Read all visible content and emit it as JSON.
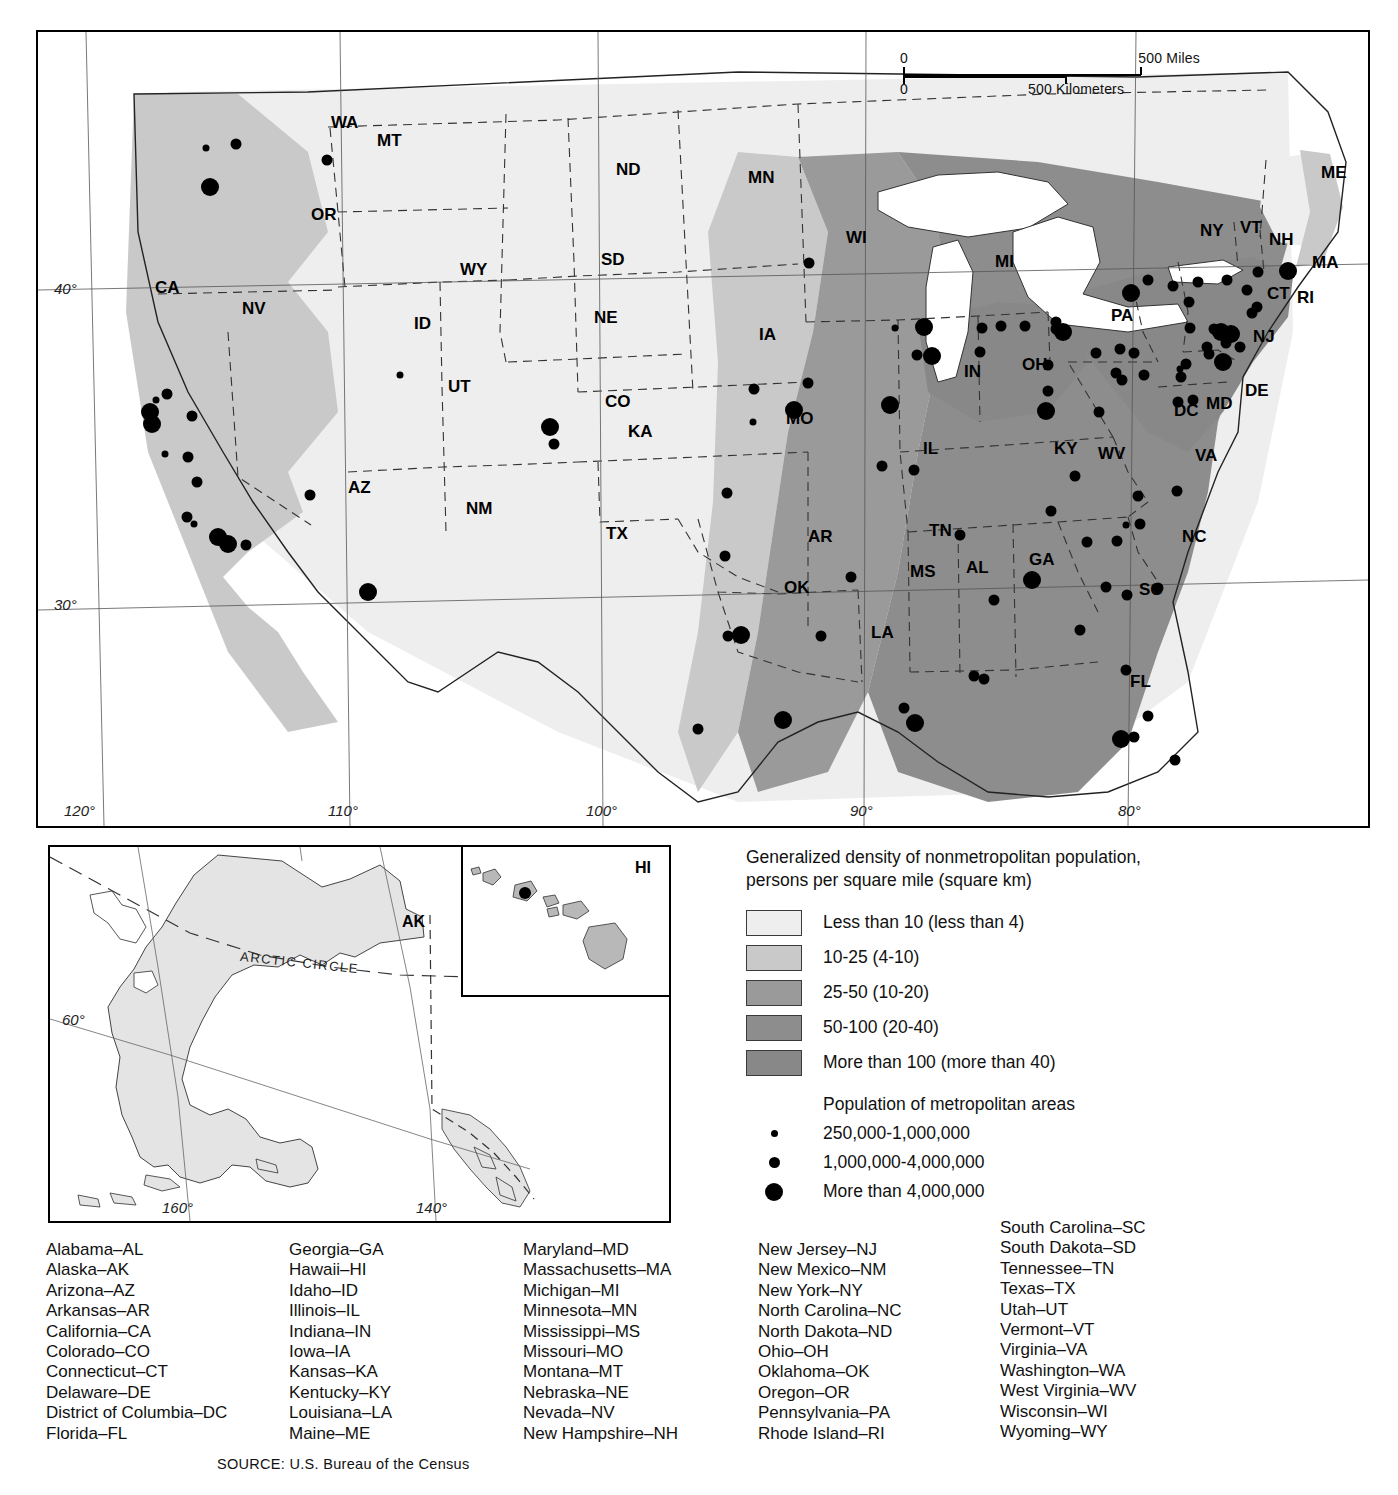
{
  "map": {
    "title_implicit": "Generalized density of nonmetropolitan population",
    "scale": {
      "miles_zero": "0",
      "miles_max": "500 Miles",
      "km_zero": "0",
      "km_max": "500 Kilometers"
    },
    "longitude_labels": [
      "120°",
      "110°",
      "100°",
      "90°",
      "80°"
    ],
    "latitude_labels": [
      "40°",
      "30°"
    ],
    "state_labels": [
      {
        "abbr": "WA",
        "x": 293,
        "y": 96
      },
      {
        "abbr": "MT",
        "x": 339,
        "y": 114
      },
      {
        "abbr": "ND",
        "x": 578,
        "y": 143
      },
      {
        "abbr": "MN",
        "x": 710,
        "y": 151
      },
      {
        "abbr": "OR",
        "x": 273,
        "y": 188
      },
      {
        "abbr": "WI",
        "x": 808,
        "y": 211
      },
      {
        "abbr": "MI",
        "x": 957,
        "y": 235
      },
      {
        "abbr": "ME",
        "x": 1283,
        "y": 146
      },
      {
        "abbr": "NY",
        "x": 1162,
        "y": 204
      },
      {
        "abbr": "VT",
        "x": 1202,
        "y": 201
      },
      {
        "abbr": "NH",
        "x": 1231,
        "y": 213
      },
      {
        "abbr": "MA",
        "x": 1274,
        "y": 236
      },
      {
        "abbr": "SD",
        "x": 563,
        "y": 233
      },
      {
        "abbr": "WY",
        "x": 422,
        "y": 243
      },
      {
        "abbr": "CA",
        "x": 117,
        "y": 261
      },
      {
        "abbr": "NV",
        "x": 204,
        "y": 282
      },
      {
        "abbr": "ID",
        "x": 376,
        "y": 297
      },
      {
        "abbr": "NE",
        "x": 556,
        "y": 291
      },
      {
        "abbr": "IA",
        "x": 721,
        "y": 308
      },
      {
        "abbr": "PA",
        "x": 1073,
        "y": 289
      },
      {
        "abbr": "CT",
        "x": 1229,
        "y": 267
      },
      {
        "abbr": "RI",
        "x": 1259,
        "y": 271
      },
      {
        "abbr": "OH",
        "x": 984,
        "y": 338
      },
      {
        "abbr": "IN",
        "x": 926,
        "y": 345
      },
      {
        "abbr": "NJ",
        "x": 1215,
        "y": 310
      },
      {
        "abbr": "UT",
        "x": 410,
        "y": 360
      },
      {
        "abbr": "CO",
        "x": 567,
        "y": 375
      },
      {
        "abbr": "MO",
        "x": 748,
        "y": 392
      },
      {
        "abbr": "KA",
        "x": 590,
        "y": 405
      },
      {
        "abbr": "DC",
        "x": 1136,
        "y": 384
      },
      {
        "abbr": "MD",
        "x": 1168,
        "y": 377
      },
      {
        "abbr": "DE",
        "x": 1207,
        "y": 364
      },
      {
        "abbr": "IL",
        "x": 885,
        "y": 422
      },
      {
        "abbr": "KY",
        "x": 1016,
        "y": 422
      },
      {
        "abbr": "WV",
        "x": 1060,
        "y": 427
      },
      {
        "abbr": "VA",
        "x": 1157,
        "y": 429
      },
      {
        "abbr": "AZ",
        "x": 310,
        "y": 461
      },
      {
        "abbr": "NM",
        "x": 428,
        "y": 482
      },
      {
        "abbr": "TN",
        "x": 891,
        "y": 504
      },
      {
        "abbr": "AR",
        "x": 770,
        "y": 510
      },
      {
        "abbr": "NC",
        "x": 1144,
        "y": 510
      },
      {
        "abbr": "TX",
        "x": 568,
        "y": 507
      },
      {
        "abbr": "MS",
        "x": 872,
        "y": 545
      },
      {
        "abbr": "AL",
        "x": 928,
        "y": 541
      },
      {
        "abbr": "GA",
        "x": 991,
        "y": 533
      },
      {
        "abbr": "SC",
        "x": 1101,
        "y": 563
      },
      {
        "abbr": "OK",
        "x": 746,
        "y": 561
      },
      {
        "abbr": "LA",
        "x": 833,
        "y": 606
      },
      {
        "abbr": "FL",
        "x": 1092,
        "y": 655
      }
    ]
  },
  "insets": {
    "alaska": {
      "label": "AK",
      "arctic_circle": "ARCTIC CIRCLE",
      "lat_label": "60°",
      "lon_labels": [
        "160°",
        "140°"
      ]
    },
    "hawaii": {
      "label": "HI"
    }
  },
  "legend": {
    "title": "Generalized density of nonmetropolitan population,\npersons per square mile (square km)",
    "density_classes": [
      {
        "label": "Less than 10 (less than 4)",
        "color": "#eeeeee"
      },
      {
        "label": "10-25 (4-10)",
        "color": "#c9c9c9"
      },
      {
        "label": "25-50 (10-20)",
        "color": "#9a9a9a"
      },
      {
        "label": "50-100 (20-40)",
        "color": "#8d8d8d"
      },
      {
        "label": "More than 100 (more than 40)",
        "color": "#888888"
      }
    ],
    "metro_title": "Population of metropolitan areas",
    "metro_classes": [
      {
        "label": "250,000-1,000,000",
        "size": "small"
      },
      {
        "label": "1,000,000-4,000,000",
        "size": "medium"
      },
      {
        "label": "More than 4,000,000",
        "size": "large"
      }
    ]
  },
  "abbreviations": {
    "column_1": [
      "Alabama–AL",
      "Alaska–AK",
      "Arizona–AZ",
      "Arkansas–AR",
      "California–CA",
      "Colorado–CO",
      "Connecticut–CT",
      "Delaware–DE",
      "District of Columbia–DC",
      "Florida–FL"
    ],
    "column_2": [
      "Georgia–GA",
      "Hawaii–HI",
      "Idaho–ID",
      "Illinois–IL",
      "Indiana–IN",
      "Iowa–IA",
      "Kansas–KA",
      "Kentucky–KY",
      "Louisiana–LA",
      "Maine–ME"
    ],
    "column_3": [
      "Maryland–MD",
      "Massachusetts–MA",
      "Michigan–MI",
      "Minnesota–MN",
      "Mississippi–MS",
      "Missouri–MO",
      "Montana–MT",
      "Nebraska–NE",
      "Nevada–NV",
      "New Hampshire–NH"
    ],
    "column_4": [
      "New Jersey–NJ",
      "New Mexico–NM",
      "New York–NY",
      "North Carolina–NC",
      "North Dakota–ND",
      "Ohio–OH",
      "Oklahoma–OK",
      "Oregon–OR",
      "Pennsylvania–PA",
      "Rhode Island–RI"
    ],
    "column_5": [
      "South Carolina–SC",
      "South Dakota–SD",
      "Tennessee–TN",
      "Texas–TX",
      "Utah–UT",
      "Vermont–VT",
      "Virginia–VA",
      "Washington–WA",
      "West Virginia–WV",
      "Wisconsin–WI",
      "Wyoming–WY"
    ]
  },
  "source": "SOURCE: U.S. Bureau of the Census",
  "chart_data": {
    "type": "map",
    "title": "Generalized density of nonmetropolitan population, persons per square mile (square km)",
    "density_bands": [
      {
        "class": "Less than 10 (less than 4)",
        "fill": "#eeeeee"
      },
      {
        "class": "10-25 (4-10)",
        "fill": "#c9c9c9"
      },
      {
        "class": "25-50 (10-20)",
        "fill": "#9a9a9a"
      },
      {
        "class": "50-100 (20-40)",
        "fill": "#8d8d8d"
      },
      {
        "class": "More than 100 (more than 40)",
        "fill": "#888888"
      }
    ],
    "metro_symbol_sizes": [
      {
        "class": "250,000-1,000,000",
        "radius_px": 3.5
      },
      {
        "class": "1,000,000-4,000,000",
        "radius_px": 5.5
      },
      {
        "class": "More than 4,000,000",
        "radius_px": 9
      }
    ],
    "metro_points": [
      {
        "x": 198,
        "y": 112,
        "size": "m"
      },
      {
        "x": 172,
        "y": 155,
        "size": "l"
      },
      {
        "x": 168,
        "y": 116,
        "size": "s"
      },
      {
        "x": 289,
        "y": 128,
        "size": "m"
      },
      {
        "x": 129,
        "y": 362,
        "size": "m"
      },
      {
        "x": 118,
        "y": 368,
        "size": "s"
      },
      {
        "x": 112,
        "y": 380,
        "size": "l"
      },
      {
        "x": 114,
        "y": 392,
        "size": "l"
      },
      {
        "x": 154,
        "y": 384,
        "size": "m"
      },
      {
        "x": 150,
        "y": 425,
        "size": "m"
      },
      {
        "x": 127,
        "y": 422,
        "size": "s"
      },
      {
        "x": 159,
        "y": 450,
        "size": "m"
      },
      {
        "x": 149,
        "y": 485,
        "size": "m"
      },
      {
        "x": 156,
        "y": 492,
        "size": "s"
      },
      {
        "x": 180,
        "y": 505,
        "size": "l"
      },
      {
        "x": 190,
        "y": 512,
        "size": "l"
      },
      {
        "x": 208,
        "y": 513,
        "size": "m"
      },
      {
        "x": 272,
        "y": 463,
        "size": "m"
      },
      {
        "x": 330,
        "y": 560,
        "size": "l"
      },
      {
        "x": 362,
        "y": 343,
        "size": "s"
      },
      {
        "x": 512,
        "y": 395,
        "size": "l"
      },
      {
        "x": 516,
        "y": 412,
        "size": "m"
      },
      {
        "x": 689,
        "y": 461,
        "size": "m"
      },
      {
        "x": 687,
        "y": 524,
        "size": "m"
      },
      {
        "x": 660,
        "y": 697,
        "size": "m"
      },
      {
        "x": 690,
        "y": 604,
        "size": "m"
      },
      {
        "x": 703,
        "y": 603,
        "size": "l"
      },
      {
        "x": 745,
        "y": 688,
        "size": "l"
      },
      {
        "x": 771,
        "y": 231,
        "size": "m"
      },
      {
        "x": 770,
        "y": 351,
        "size": "m"
      },
      {
        "x": 756,
        "y": 378,
        "size": "l"
      },
      {
        "x": 716,
        "y": 357,
        "size": "m"
      },
      {
        "x": 715,
        "y": 390,
        "size": "s"
      },
      {
        "x": 783,
        "y": 604,
        "size": "m"
      },
      {
        "x": 813,
        "y": 545,
        "size": "m"
      },
      {
        "x": 844,
        "y": 434,
        "size": "m"
      },
      {
        "x": 852,
        "y": 373,
        "size": "l"
      },
      {
        "x": 866,
        "y": 676,
        "size": "m"
      },
      {
        "x": 877,
        "y": 691,
        "size": "l"
      },
      {
        "x": 857,
        "y": 296,
        "size": "s"
      },
      {
        "x": 886,
        "y": 295,
        "size": "l"
      },
      {
        "x": 894,
        "y": 324,
        "size": "l"
      },
      {
        "x": 879,
        "y": 323,
        "size": "m"
      },
      {
        "x": 876,
        "y": 438,
        "size": "m"
      },
      {
        "x": 936,
        "y": 644,
        "size": "m"
      },
      {
        "x": 946,
        "y": 647,
        "size": "m"
      },
      {
        "x": 922,
        "y": 503,
        "size": "m"
      },
      {
        "x": 956,
        "y": 568,
        "size": "m"
      },
      {
        "x": 944,
        "y": 296,
        "size": "m"
      },
      {
        "x": 942,
        "y": 320,
        "size": "m"
      },
      {
        "x": 963,
        "y": 294,
        "size": "m"
      },
      {
        "x": 987,
        "y": 294,
        "size": "m"
      },
      {
        "x": 1018,
        "y": 297,
        "size": "m"
      },
      {
        "x": 1018,
        "y": 290,
        "size": "m"
      },
      {
        "x": 1025,
        "y": 300,
        "size": "l"
      },
      {
        "x": 1010,
        "y": 333,
        "size": "m"
      },
      {
        "x": 1008,
        "y": 379,
        "size": "l"
      },
      {
        "x": 1010,
        "y": 359,
        "size": "m"
      },
      {
        "x": 1093,
        "y": 261,
        "size": "l"
      },
      {
        "x": 1110,
        "y": 248,
        "size": "m"
      },
      {
        "x": 1135,
        "y": 254,
        "size": "m"
      },
      {
        "x": 1160,
        "y": 250,
        "size": "m"
      },
      {
        "x": 1189,
        "y": 248,
        "size": "m"
      },
      {
        "x": 1220,
        "y": 240,
        "size": "m"
      },
      {
        "x": 1250,
        "y": 239,
        "size": "l"
      },
      {
        "x": 1209,
        "y": 258,
        "size": "m"
      },
      {
        "x": 1219,
        "y": 275,
        "size": "m"
      },
      {
        "x": 1214,
        "y": 281,
        "size": "m"
      },
      {
        "x": 1151,
        "y": 270,
        "size": "m"
      },
      {
        "x": 1152,
        "y": 296,
        "size": "m"
      },
      {
        "x": 1176,
        "y": 297,
        "size": "m"
      },
      {
        "x": 1183,
        "y": 300,
        "size": "l"
      },
      {
        "x": 1193,
        "y": 302,
        "size": "l"
      },
      {
        "x": 1188,
        "y": 311,
        "size": "m"
      },
      {
        "x": 1169,
        "y": 315,
        "size": "m"
      },
      {
        "x": 1171,
        "y": 322,
        "size": "m"
      },
      {
        "x": 1202,
        "y": 315,
        "size": "m"
      },
      {
        "x": 1185,
        "y": 330,
        "size": "l"
      },
      {
        "x": 1148,
        "y": 332,
        "size": "m"
      },
      {
        "x": 1142,
        "y": 337,
        "size": "s"
      },
      {
        "x": 1143,
        "y": 345,
        "size": "m"
      },
      {
        "x": 1140,
        "y": 370,
        "size": "m"
      },
      {
        "x": 1155,
        "y": 368,
        "size": "m"
      },
      {
        "x": 1106,
        "y": 343,
        "size": "m"
      },
      {
        "x": 1078,
        "y": 341,
        "size": "m"
      },
      {
        "x": 1084,
        "y": 348,
        "size": "m"
      },
      {
        "x": 1058,
        "y": 321,
        "size": "m"
      },
      {
        "x": 1082,
        "y": 317,
        "size": "m"
      },
      {
        "x": 1096,
        "y": 321,
        "size": "m"
      },
      {
        "x": 1139,
        "y": 459,
        "size": "m"
      },
      {
        "x": 1100,
        "y": 464,
        "size": "m"
      },
      {
        "x": 1102,
        "y": 492,
        "size": "m"
      },
      {
        "x": 1088,
        "y": 493,
        "size": "s"
      },
      {
        "x": 1079,
        "y": 509,
        "size": "m"
      },
      {
        "x": 1049,
        "y": 510,
        "size": "m"
      },
      {
        "x": 1120,
        "y": 556,
        "size": "m"
      },
      {
        "x": 1068,
        "y": 555,
        "size": "m"
      },
      {
        "x": 1089,
        "y": 563,
        "size": "m"
      },
      {
        "x": 1088,
        "y": 638,
        "size": "m"
      },
      {
        "x": 1110,
        "y": 684,
        "size": "m"
      },
      {
        "x": 1096,
        "y": 705,
        "size": "m"
      },
      {
        "x": 1083,
        "y": 707,
        "size": "l"
      },
      {
        "x": 1137,
        "y": 728,
        "size": "m"
      },
      {
        "x": 1042,
        "y": 598,
        "size": "m"
      },
      {
        "x": 1013,
        "y": 479,
        "size": "m"
      },
      {
        "x": 994,
        "y": 548,
        "size": "l"
      },
      {
        "x": 1061,
        "y": 380,
        "size": "m"
      },
      {
        "x": 1037,
        "y": 444,
        "size": "m"
      }
    ]
  }
}
